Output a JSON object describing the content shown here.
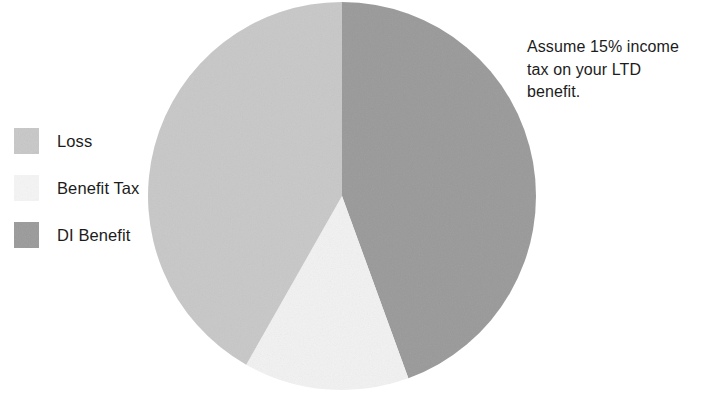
{
  "chart_data": {
    "type": "pie",
    "title": "",
    "categories": [
      "DI Benefit",
      "Benefit Tax",
      "Loss"
    ],
    "values": [
      44.4,
      13.8,
      41.8
    ],
    "units": "percent",
    "start_angle_deg": 0,
    "direction": "clockwise",
    "slices": [
      {
        "label": "DI Benefit",
        "value": 44.4,
        "color": "#9a9a9a",
        "start_deg": 0.0,
        "end_deg": 160.0
      },
      {
        "label": "Benefit Tax",
        "value": 13.8,
        "color": "#f2f2f2",
        "start_deg": 160.0,
        "end_deg": 209.6
      },
      {
        "label": "Loss",
        "value": 41.8,
        "color": "#c8c8c8",
        "start_deg": 209.6,
        "end_deg": 360.0
      }
    ],
    "legend": {
      "position": "left",
      "entries": [
        {
          "label": "Loss",
          "color": "#c8c8c8"
        },
        {
          "label": "Benefit Tax",
          "color": "#f2f2f2"
        },
        {
          "label": "DI Benefit",
          "color": "#9a9a9a"
        }
      ]
    },
    "annotations": [
      {
        "text": "Assume 15% income tax on your LTD benefit.",
        "position": "right"
      }
    ],
    "xlabel": "",
    "ylabel": "",
    "grid": false
  },
  "legend": {
    "items": [
      {
        "label": "Loss"
      },
      {
        "label": "Benefit Tax"
      },
      {
        "label": "DI Benefit"
      }
    ]
  },
  "annotation": {
    "text": "Assume 15% income tax on your LTD benefit."
  },
  "colors": {
    "loss": "#c8c8c8",
    "benefit_tax": "#f2f2f2",
    "di_benefit": "#9a9a9a",
    "text": "#1c1c1c",
    "background": "#ffffff"
  }
}
